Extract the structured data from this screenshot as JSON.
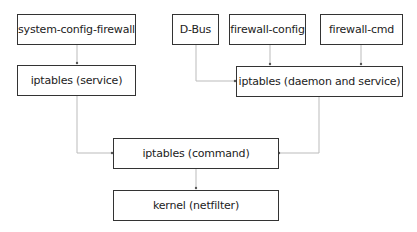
{
  "diagram": {
    "nodes": [
      {
        "id": "scf",
        "label": "system-config-firewall"
      },
      {
        "id": "ipt_service",
        "label": "iptables (service)"
      },
      {
        "id": "dbus",
        "label": "D-Bus"
      },
      {
        "id": "fw_config",
        "label": "firewall-config"
      },
      {
        "id": "fw_cmd",
        "label": "firewall-cmd"
      },
      {
        "id": "ipt_daemon",
        "label": "iptables (daemon and service)"
      },
      {
        "id": "ipt_command",
        "label": "iptables (command)"
      },
      {
        "id": "kernel",
        "label": "kernel (netfilter)"
      }
    ],
    "edges": [
      {
        "from": "scf",
        "to": "ipt_service"
      },
      {
        "from": "dbus",
        "to": "ipt_daemon"
      },
      {
        "from": "fw_config",
        "to": "ipt_daemon"
      },
      {
        "from": "fw_cmd",
        "to": "ipt_daemon"
      },
      {
        "from": "ipt_service",
        "to": "ipt_command"
      },
      {
        "from": "ipt_daemon",
        "to": "ipt_command"
      },
      {
        "from": "ipt_command",
        "to": "kernel"
      }
    ],
    "colors": {
      "border": "#333333",
      "edge": "#bbbbbb",
      "arrow": "#555555"
    }
  }
}
